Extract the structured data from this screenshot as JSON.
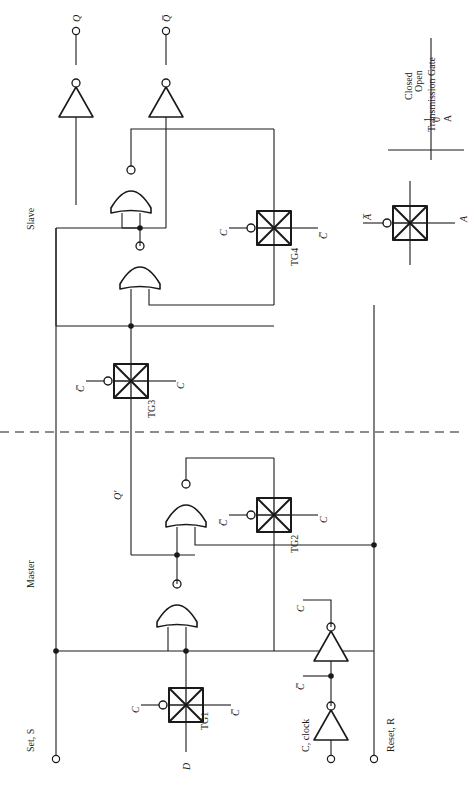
{
  "figure": {
    "orientation": "rotated-90",
    "line_color": "#1a1a1a",
    "background": "#ffffff"
  },
  "sections": {
    "master_label": "Master",
    "slave_label": "Slave",
    "divider": "dashed"
  },
  "ports": {
    "set": "Set, S",
    "reset": "Reset, R",
    "clock": "C, clock",
    "data": "D",
    "q": "Q",
    "qbar": "Q̅",
    "qprime": "Q′"
  },
  "signals": {
    "c": "C",
    "cbar": "C̅",
    "a": "A",
    "abar": "A̅"
  },
  "transmission_gates": [
    {
      "id": "TG1",
      "label": "TG1",
      "left_signal": "C",
      "right_signal": "C̅",
      "bubble_side": "left"
    },
    {
      "id": "TG2",
      "label": "TG2",
      "left_signal": "C̅",
      "right_signal": "C",
      "bubble_side": "left"
    },
    {
      "id": "TG3",
      "label": "TG3",
      "left_signal": "C̅",
      "right_signal": "C",
      "bubble_side": "left"
    },
    {
      "id": "TG4",
      "label": "TG4",
      "left_signal": "C",
      "right_signal": "C̅",
      "bubble_side": "left"
    }
  ],
  "gates": {
    "nor_count": 4,
    "inverter_count": 4,
    "nor_type": "NOR",
    "inverter_type": "INV"
  },
  "legend": {
    "symbol_left": "A̅",
    "symbol_right": "A",
    "table": {
      "col_input": "A",
      "col_state": "Transmission Gate",
      "rows": [
        {
          "input": "0",
          "state": "Open"
        },
        {
          "input": "1",
          "state": "Closed"
        }
      ]
    }
  }
}
